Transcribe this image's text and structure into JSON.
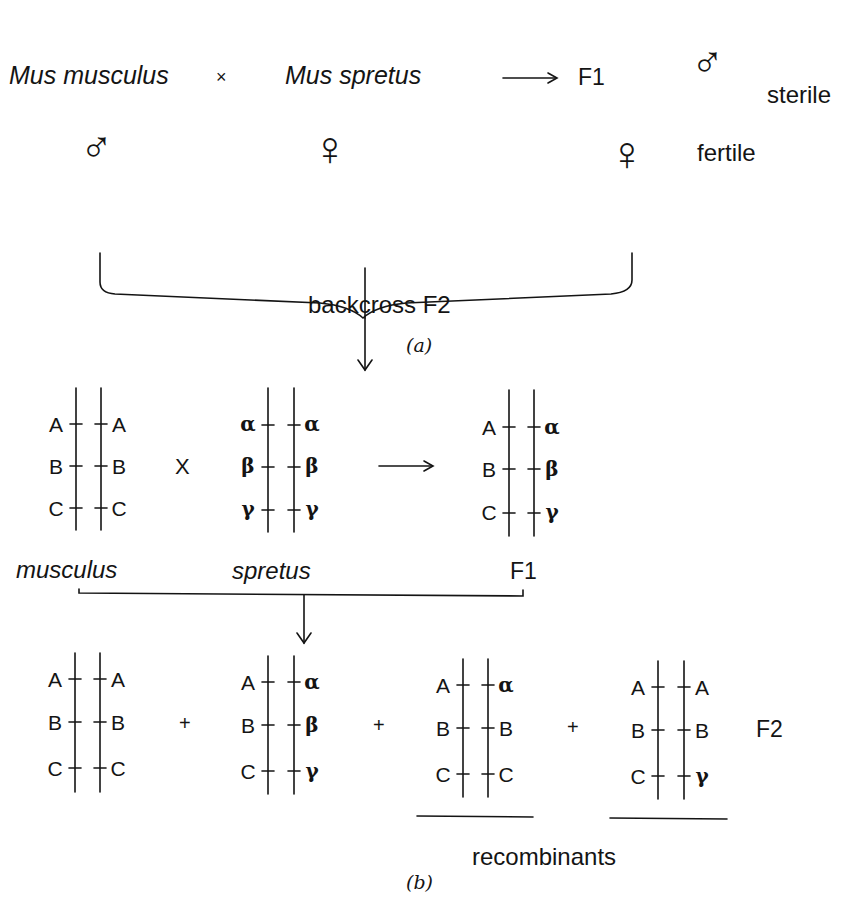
{
  "panel_a": {
    "species_left": "Mus musculus",
    "cross_symbol": "×",
    "species_right": "Mus spretus",
    "arrow": "⟶",
    "offspring": "F1",
    "male_symbol": "♂",
    "female_symbol": "♀",
    "sterile_label": "sterile",
    "fertile_label": "fertile",
    "result_label": "backcross F2",
    "caption": "(a)"
  },
  "panel_b": {
    "cross_symbol": "X",
    "arrow": "⟶",
    "plus": "+",
    "parents": [
      {
        "name": "musculus",
        "left": [
          "A",
          "B",
          "C"
        ],
        "right": [
          "A",
          "B",
          "C"
        ]
      },
      {
        "name": "spretus",
        "left": [
          "α",
          "β",
          "γ"
        ],
        "right": [
          "α",
          "β",
          "γ"
        ]
      },
      {
        "name": "F1",
        "left": [
          "A",
          "B",
          "C"
        ],
        "right": [
          "α",
          "β",
          "γ"
        ]
      }
    ],
    "f2": [
      {
        "left": [
          "A",
          "B",
          "C"
        ],
        "right": [
          "A",
          "B",
          "C"
        ]
      },
      {
        "left": [
          "A",
          "B",
          "C"
        ],
        "right": [
          "α",
          "β",
          "γ"
        ]
      },
      {
        "left": [
          "A",
          "B",
          "C"
        ],
        "right": [
          "α",
          "B",
          "C"
        ]
      },
      {
        "left": [
          "A",
          "B",
          "C"
        ],
        "right": [
          "A",
          "B",
          "γ"
        ]
      }
    ],
    "f2_label": "F2",
    "recombinants_label": "recombinants",
    "caption": "(b)"
  }
}
